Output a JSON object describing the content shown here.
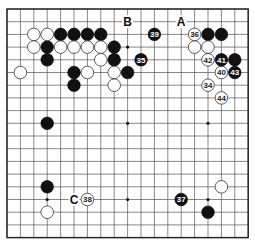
{
  "board": {
    "size": 19,
    "origin_x": 7,
    "origin_y": 9,
    "spacing_x": 13.4,
    "spacing_y": 12.7,
    "stone_radius": 6.3,
    "colors": {
      "black": "#111111",
      "white": "#ffffff",
      "line": "#555555",
      "background": "#ffffff"
    },
    "star_points": [
      [
        3,
        3
      ],
      [
        9,
        3
      ],
      [
        15,
        3
      ],
      [
        3,
        9
      ],
      [
        9,
        9
      ],
      [
        15,
        9
      ],
      [
        3,
        15
      ],
      [
        9,
        15
      ],
      [
        15,
        15
      ]
    ],
    "black_stones": [
      [
        4,
        2
      ],
      [
        5,
        2
      ],
      [
        6,
        2
      ],
      [
        7,
        2
      ],
      [
        3,
        3
      ],
      [
        8,
        3
      ],
      [
        3,
        4
      ],
      [
        8,
        4
      ],
      [
        5,
        5
      ],
      [
        9,
        5
      ],
      [
        5,
        6
      ],
      [
        15,
        2
      ],
      [
        16,
        2
      ],
      [
        17,
        4
      ],
      [
        3,
        9
      ],
      [
        3,
        14
      ],
      [
        15,
        16
      ]
    ],
    "white_stones": [
      [
        2,
        2
      ],
      [
        3,
        2
      ],
      [
        2,
        3
      ],
      [
        4,
        3
      ],
      [
        5,
        3
      ],
      [
        6,
        3
      ],
      [
        7,
        3
      ],
      [
        7,
        4
      ],
      [
        1,
        5
      ],
      [
        6,
        5
      ],
      [
        8,
        5
      ],
      [
        8,
        6
      ],
      [
        14,
        3
      ],
      [
        15,
        3
      ],
      [
        3,
        16
      ],
      [
        16,
        14
      ]
    ],
    "numbered_moves": [
      {
        "n": "34",
        "color": "white",
        "x": 15,
        "y": 6
      },
      {
        "n": "35",
        "color": "black",
        "x": 10,
        "y": 4
      },
      {
        "n": "36",
        "color": "white",
        "x": 14,
        "y": 2
      },
      {
        "n": "37",
        "color": "black",
        "x": 13,
        "y": 15
      },
      {
        "n": "38",
        "color": "white",
        "x": 6,
        "y": 15
      },
      {
        "n": "39",
        "color": "black",
        "x": 11,
        "y": 2
      },
      {
        "n": "40",
        "color": "white",
        "x": 16,
        "y": 5
      },
      {
        "n": "41",
        "color": "black",
        "x": 16,
        "y": 4
      },
      {
        "n": "42",
        "color": "white",
        "x": 15,
        "y": 4
      },
      {
        "n": "43",
        "color": "black",
        "x": 17,
        "y": 5
      },
      {
        "n": "44",
        "color": "white",
        "x": 16,
        "y": 7
      }
    ],
    "labels": [
      {
        "text": "A",
        "x": 13,
        "y": 1
      },
      {
        "text": "B",
        "x": 9,
        "y": 1
      },
      {
        "text": "C",
        "x": 5,
        "y": 15
      }
    ]
  }
}
